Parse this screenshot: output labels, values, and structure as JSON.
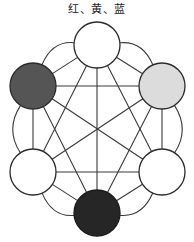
{
  "figure": {
    "caption": "红、黄、蓝",
    "background_color": "#ffffff",
    "stroke_color": "#3a3a3a",
    "stroke_width": 1.1,
    "node_stroke_color": "#2b2b2b",
    "node_stroke_width": 1.3,
    "node_radius": 23,
    "outer_arc_bulge": 14,
    "center": {
      "x": 97,
      "y": 128
    }
  },
  "chart_data": {
    "type": "diagram",
    "title": "红、黄、蓝",
    "layout": "hexagon-complete-graph-K6",
    "grid": false,
    "legend": null,
    "xlabel": "",
    "ylabel": "",
    "nodes": [
      {
        "id": "top",
        "label": "",
        "position": "top",
        "x": 97,
        "y": 45,
        "r": 23,
        "fill": "#ffffff",
        "stroke": "#2b2b2b",
        "tone": "white"
      },
      {
        "id": "upper-right",
        "label": "黄",
        "position": "upper-right",
        "x": 162,
        "y": 86,
        "r": 23,
        "fill": "#dcdcdc",
        "stroke": "#2b2b2b",
        "tone": "light-gray"
      },
      {
        "id": "lower-right",
        "label": "",
        "position": "lower-right",
        "x": 162,
        "y": 172,
        "r": 23,
        "fill": "#ffffff",
        "stroke": "#2b2b2b",
        "tone": "white"
      },
      {
        "id": "bottom",
        "label": "蓝",
        "position": "bottom",
        "x": 97,
        "y": 213,
        "r": 23,
        "fill": "#262626",
        "stroke": "#1a1a1a",
        "tone": "near-black"
      },
      {
        "id": "lower-left",
        "label": "",
        "position": "lower-left",
        "x": 33,
        "y": 172,
        "r": 23,
        "fill": "#ffffff",
        "stroke": "#2b2b2b",
        "tone": "white"
      },
      {
        "id": "upper-left",
        "label": "红",
        "position": "upper-left",
        "x": 33,
        "y": 86,
        "r": 23,
        "fill": "#555555",
        "stroke": "#2b2b2b",
        "tone": "dark-gray"
      }
    ],
    "edges": [
      {
        "from": "top",
        "to": "upper-right",
        "kind": "chord"
      },
      {
        "from": "top",
        "to": "lower-right",
        "kind": "chord"
      },
      {
        "from": "top",
        "to": "bottom",
        "kind": "chord"
      },
      {
        "from": "top",
        "to": "lower-left",
        "kind": "chord"
      },
      {
        "from": "top",
        "to": "upper-left",
        "kind": "chord"
      },
      {
        "from": "upper-right",
        "to": "lower-right",
        "kind": "chord"
      },
      {
        "from": "upper-right",
        "to": "bottom",
        "kind": "chord"
      },
      {
        "from": "upper-right",
        "to": "lower-left",
        "kind": "chord"
      },
      {
        "from": "upper-right",
        "to": "upper-left",
        "kind": "chord"
      },
      {
        "from": "lower-right",
        "to": "bottom",
        "kind": "chord"
      },
      {
        "from": "lower-right",
        "to": "lower-left",
        "kind": "chord"
      },
      {
        "from": "lower-right",
        "to": "upper-left",
        "kind": "chord"
      },
      {
        "from": "bottom",
        "to": "lower-left",
        "kind": "chord"
      },
      {
        "from": "bottom",
        "to": "upper-left",
        "kind": "chord"
      },
      {
        "from": "lower-left",
        "to": "upper-left",
        "kind": "chord"
      }
    ],
    "outer_arcs": [
      {
        "from": "top",
        "to": "upper-right"
      },
      {
        "from": "upper-right",
        "to": "lower-right"
      },
      {
        "from": "lower-right",
        "to": "bottom"
      },
      {
        "from": "bottom",
        "to": "lower-left"
      },
      {
        "from": "lower-left",
        "to": "upper-left"
      },
      {
        "from": "upper-left",
        "to": "top"
      }
    ]
  }
}
